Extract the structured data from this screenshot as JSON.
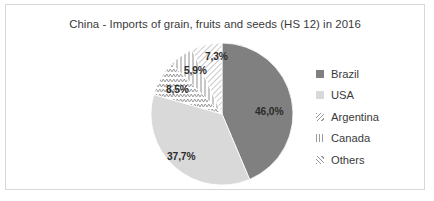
{
  "frame": {
    "border_color": "#d8d8d8",
    "background": "#ffffff"
  },
  "chart_data": {
    "type": "pie",
    "title": "China - Imports of grain, fruits and seeds (HS 12) in 2016",
    "xlabel": "",
    "ylabel": "",
    "legend_position": "right",
    "grid": false,
    "categories": [
      "Brazil",
      "USA",
      "Argentina",
      "Canada",
      "Others"
    ],
    "values": [
      46.0,
      37.7,
      8.5,
      5.9,
      7.3
    ],
    "value_labels": [
      "46,0%",
      "37,7%",
      "8,5%",
      "5,9%",
      "7,3%"
    ],
    "slices": [
      {
        "name": "Brazil",
        "value": 46.0,
        "label": "46,0%",
        "fill": "#808080",
        "pattern": "solid",
        "swatch_name": "legend-swatch-brazil",
        "label_x": 249,
        "label_y": 101
      },
      {
        "name": "USA",
        "value": 37.7,
        "label": "37,7%",
        "fill": "#d9d9d9",
        "pattern": "solid",
        "swatch_name": "legend-swatch-usa",
        "label_x": 161,
        "label_y": 146
      },
      {
        "name": "Argentina",
        "value": 8.5,
        "label": "8,5%",
        "fill": "#ffffff",
        "pattern": "zigzag",
        "swatch_name": "legend-swatch-argentina",
        "label_x": 160,
        "label_y": 79
      },
      {
        "name": "Canada",
        "value": 5.9,
        "label": "5,9%",
        "fill": "#ffffff",
        "pattern": "vertical-lines",
        "swatch_name": "legend-swatch-canada",
        "label_x": 178,
        "label_y": 60
      },
      {
        "name": "Others",
        "value": 7.3,
        "label": "7,3%",
        "fill": "#ffffff",
        "pattern": "diagonal-hatch",
        "swatch_name": "legend-swatch-others",
        "label_x": 199,
        "label_y": 46
      }
    ],
    "geometry": {
      "center_x": 219,
      "center_y": 113,
      "radius": 71,
      "start_angle_deg": 0,
      "direction": "clockwise"
    }
  },
  "legend": {
    "items": [
      {
        "label": "Brazil"
      },
      {
        "label": "USA"
      },
      {
        "label": "Argentina"
      },
      {
        "label": "Canada"
      },
      {
        "label": "Others"
      }
    ]
  }
}
